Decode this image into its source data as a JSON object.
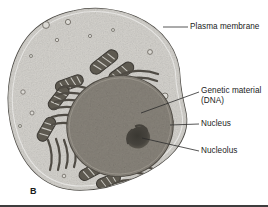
{
  "figure": {
    "panel_letter": "B",
    "style": "grayscale-electron-micrograph-illustration"
  },
  "labels": {
    "plasma_membrane": "Plasma membrane",
    "genetic_material": "Genetic material\n(DNA)",
    "nucleus": "Nucleus",
    "nucleolus": "Nucleolus"
  },
  "colors": {
    "cytoplasm": "#cfcdc8",
    "cytoplasm_light": "#dedcd7",
    "membrane_outline": "#4a4843",
    "nucleus_fill": "#8a857c",
    "nucleus_outline": "#56524b",
    "nucleolus": "#45423c",
    "organelle": "#55514a",
    "leader_line": "#2b2b2b",
    "text": "#1b1b1b",
    "background": "#ffffff",
    "border": "#3d3d3d"
  },
  "structures": {
    "mitochondria_count": 7,
    "endoplasmic_reticulum_clusters": 4,
    "vesicle_count": 14
  }
}
